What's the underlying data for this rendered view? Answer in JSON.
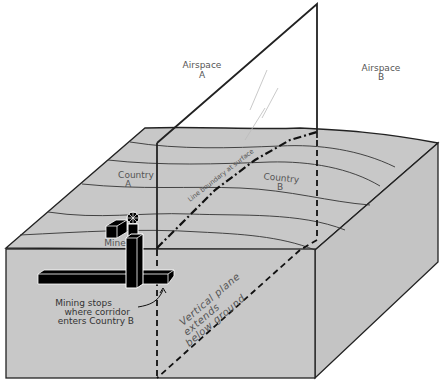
{
  "diagram": {
    "type": "block-diagram",
    "colors": {
      "ground": "#c8c8c8",
      "ground_side": "#c4c4c4",
      "outline": "#222222",
      "label": "#555555",
      "mine": "#000000"
    },
    "labels": {
      "airspace_a_line1": "Airspace",
      "airspace_a_line2": "A",
      "airspace_b_line1": "Airspace",
      "airspace_b_line2": "B",
      "country_a_line1": "Country",
      "country_a_line2": "A",
      "country_b_line1": "Country",
      "country_b_line2": "B",
      "boundary_surface": "Line boundary at surface",
      "mine": "Mine",
      "mining_stops_line1": "Mining stops",
      "mining_stops_line2": "where corridor",
      "mining_stops_line3": "enters Country B",
      "vertical_plane_line1": "Vertical plane",
      "vertical_plane_line2": "extends",
      "vertical_plane_line3": "below ground"
    }
  }
}
